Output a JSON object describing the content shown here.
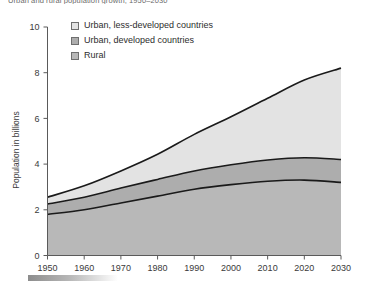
{
  "chart_title": "Urban and rural population growth, 1950–2030",
  "legend": {
    "items": [
      {
        "label": "Urban, less-developed countries",
        "color": "#e3e3e3",
        "key": "urban_less_developed"
      },
      {
        "label": "Urban, developed countries",
        "color": "#adadad",
        "key": "urban_developed"
      },
      {
        "label": "Rural",
        "color": "#b8b8b8",
        "key": "rural"
      }
    ]
  },
  "axes": {
    "ylabel": "Population in billions",
    "xlabel": "",
    "yticks": [
      "0",
      "2",
      "4",
      "6",
      "8",
      "10"
    ],
    "xticks": [
      "1950",
      "1960",
      "1970",
      "1980",
      "1990",
      "2000",
      "2010",
      "2020",
      "2030"
    ]
  },
  "colors": {
    "urban_less_developed": "#e3e3e3",
    "urban_developed": "#adadad",
    "rural": "#b8b8b8",
    "line": "#1a1a1a",
    "axis": "#5a5a5a",
    "text": "#3a3a3a",
    "footer_bar": "#8d8d8d"
  },
  "chart_data": {
    "type": "area",
    "title": "Urban and rural population growth, 1950–2030",
    "xlabel": "",
    "ylabel": "Population in billions",
    "xlim": [
      1950,
      2030
    ],
    "ylim": [
      0,
      10
    ],
    "grid": false,
    "stacked": true,
    "legend_position": "upper-left-inside",
    "x": [
      1950,
      1960,
      1970,
      1980,
      1990,
      2000,
      2010,
      2020,
      2030
    ],
    "series": [
      {
        "name": "Rural",
        "values": [
          1.8,
          2.0,
          2.3,
          2.6,
          2.9,
          3.1,
          3.25,
          3.3,
          3.2
        ]
      },
      {
        "name": "Urban, developed countries",
        "values": [
          0.45,
          0.55,
          0.65,
          0.73,
          0.8,
          0.87,
          0.93,
          0.98,
          1.0
        ]
      },
      {
        "name": "Urban, less-developed countries",
        "values": [
          0.3,
          0.5,
          0.75,
          1.1,
          1.6,
          2.1,
          2.7,
          3.4,
          4.0
        ]
      }
    ],
    "cumulative_totals": [
      2.55,
      3.05,
      3.7,
      4.43,
      5.3,
      6.07,
      6.88,
      7.68,
      8.2
    ]
  }
}
